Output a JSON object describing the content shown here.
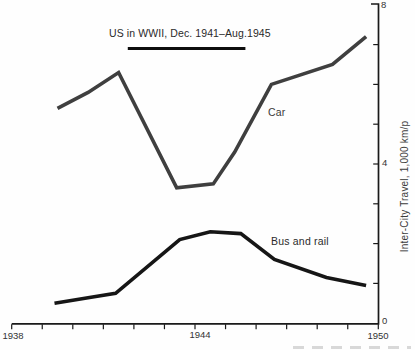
{
  "chart_data": {
    "type": "line",
    "title": "US in WWII, Dec. 1941–Aug.1945",
    "xlabel": "",
    "ylabel": "Inter-City Travel, 1,000 km/p",
    "xlim": [
      1938,
      1950
    ],
    "ylim": [
      0,
      8
    ],
    "x_tick_step": 1,
    "y_tick_step": 1,
    "x_tick_labels": [
      "1938",
      "1944",
      "1950"
    ],
    "y_tick_labels": [
      "0",
      "4",
      "8"
    ],
    "grid": "off",
    "legend": "inline-labels",
    "axis_color": "#1a1a1a",
    "annotations": [
      {
        "text": "US in WWII, Dec. 1941–Aug.1945",
        "underline_bar_years": [
          1941.8,
          1945.65
        ],
        "bar_color": "#0d0d0d"
      }
    ],
    "series": [
      {
        "name": "Car",
        "color": "#3f3f3f",
        "points": [
          [
            1939.5,
            5.4
          ],
          [
            1940.5,
            5.8
          ],
          [
            1941.5,
            6.3
          ],
          [
            1943.4,
            3.4
          ],
          [
            1944.6,
            3.5
          ],
          [
            1945.3,
            4.3
          ],
          [
            1946.5,
            6.0
          ],
          [
            1948.5,
            6.5
          ],
          [
            1949.6,
            7.2
          ]
        ]
      },
      {
        "name": "Bus and rail",
        "color": "#161616",
        "points": [
          [
            1939.4,
            0.5
          ],
          [
            1940.6,
            0.65
          ],
          [
            1941.4,
            0.75
          ],
          [
            1943.5,
            2.1
          ],
          [
            1944.5,
            2.3
          ],
          [
            1945.5,
            2.25
          ],
          [
            1946.6,
            1.6
          ],
          [
            1948.3,
            1.15
          ],
          [
            1949.6,
            0.95
          ]
        ]
      }
    ]
  }
}
